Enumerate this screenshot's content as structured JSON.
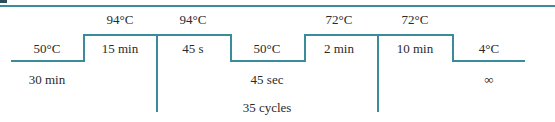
{
  "diagram": {
    "type": "thermal-cycling-profile",
    "line_color": "#3a8c9a",
    "steps": [
      {
        "temp": "50°C",
        "time": "30 min",
        "level": "low"
      },
      {
        "temp": "94°C",
        "time": "15 min",
        "level": "high"
      },
      {
        "temp": "94°C",
        "time": "45 s",
        "level": "high"
      },
      {
        "temp": "50°C",
        "time": "45 sec",
        "level": "low"
      },
      {
        "temp": "72°C",
        "time": "2 min",
        "level": "high"
      },
      {
        "temp": "72°C",
        "time": "10 min",
        "level": "high"
      },
      {
        "temp": "4°C",
        "time": "∞",
        "level": "low"
      }
    ],
    "cycle_label": "35 cycles"
  }
}
